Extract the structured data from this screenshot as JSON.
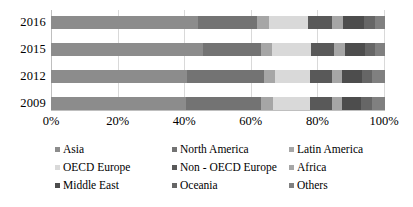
{
  "chart_data": {
    "type": "bar",
    "orientation": "horizontal",
    "stacked": true,
    "normalized": true,
    "title": "",
    "subtitle": "",
    "xlabel": "",
    "ylabel": "",
    "xlim": [
      0,
      100
    ],
    "grid": true,
    "legend_position": "bottom",
    "categories": [
      "2016",
      "2015",
      "2012",
      "2009"
    ],
    "xticks": [
      "0%",
      "20%",
      "40%",
      "60%",
      "80%",
      "100%"
    ],
    "xtick_values": [
      0,
      20,
      40,
      60,
      80,
      100
    ],
    "series": [
      {
        "name": "Asia",
        "color": "#8c8c8c",
        "values": [
          44.0,
          45.5,
          40.8,
          40.4
        ]
      },
      {
        "name": "North America",
        "color": "#737373",
        "values": [
          17.6,
          17.3,
          22.9,
          22.6
        ]
      },
      {
        "name": "Latin America",
        "color": "#a6a6a6",
        "values": [
          3.6,
          3.5,
          3.4,
          3.4
        ]
      },
      {
        "name": "OECD Europe",
        "color": "#d9d9d9",
        "values": [
          11.8,
          11.6,
          10.6,
          11.2
        ]
      },
      {
        "name": "Non-OECD Europe",
        "color": "#595959",
        "values": [
          7.2,
          6.9,
          6.4,
          6.5
        ]
      },
      {
        "name": "Africa",
        "color": "#a6a6a6",
        "values": [
          3.2,
          3.1,
          3.0,
          3.0
        ]
      },
      {
        "name": "Middle East",
        "color": "#4d4d4d",
        "values": [
          6.3,
          6.1,
          6.0,
          5.8
        ]
      },
      {
        "name": "Oceania",
        "color": "#666666",
        "values": [
          3.3,
          3.1,
          3.1,
          3.1
        ]
      },
      {
        "name": "Others",
        "color": "#808080",
        "values": [
          3.0,
          2.9,
          3.8,
          4.0
        ]
      }
    ]
  },
  "legend": {
    "items": [
      {
        "label": "Asia"
      },
      {
        "label": "North America"
      },
      {
        "label": "Latin America"
      },
      {
        "label": "OECD Europe"
      },
      {
        "label": "Non - OECD Europe"
      },
      {
        "label": "Africa"
      },
      {
        "label": "Middle East"
      },
      {
        "label": "Oceania"
      },
      {
        "label": "Others"
      }
    ]
  },
  "axes": {
    "y_labels": [
      "2016",
      "2015",
      "2012",
      "2009"
    ],
    "x_labels": [
      "0%",
      "20%",
      "40%",
      "60%",
      "80%",
      "100%"
    ]
  },
  "colors": {
    "grid": "#d9d9d9",
    "axis": "#bfbfbf",
    "text": "#000000",
    "background": "#ffffff"
  }
}
